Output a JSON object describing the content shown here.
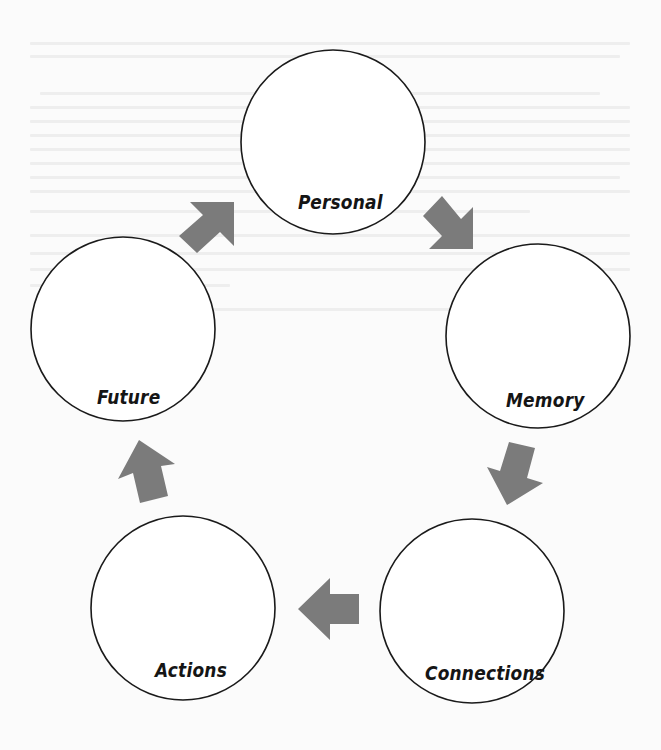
{
  "diagram": {
    "type": "cycle",
    "colors": {
      "circle_stroke": "#1a1a1a",
      "arrow_fill": "#7b7b7b",
      "background": "#ffffff",
      "label_text": "#151515"
    },
    "nodes": [
      {
        "id": "personal",
        "label": "Personal",
        "cx": 333,
        "cy": 142,
        "r": 92,
        "label_x": 298,
        "label_y": 195
      },
      {
        "id": "memory",
        "label": "Memory",
        "cx": 538,
        "cy": 336,
        "r": 92,
        "label_x": 506,
        "label_y": 393
      },
      {
        "id": "connections",
        "label": "Connections",
        "cx": 472,
        "cy": 611,
        "r": 92,
        "label_x": 425,
        "label_y": 666
      },
      {
        "id": "actions",
        "label": "Actions",
        "cx": 183,
        "cy": 608,
        "r": 92,
        "label_x": 154,
        "label_y": 663
      },
      {
        "id": "future",
        "label": "Future",
        "cx": 123,
        "cy": 329,
        "r": 92,
        "label_x": 97,
        "label_y": 390
      }
    ],
    "edges": [
      {
        "from": "personal",
        "to": "memory",
        "icon": "arrow-down-right-icon"
      },
      {
        "from": "memory",
        "to": "connections",
        "icon": "arrow-down-icon"
      },
      {
        "from": "connections",
        "to": "actions",
        "icon": "arrow-left-icon"
      },
      {
        "from": "actions",
        "to": "future",
        "icon": "arrow-up-icon"
      },
      {
        "from": "future",
        "to": "personal",
        "icon": "arrow-up-right-icon"
      }
    ]
  }
}
